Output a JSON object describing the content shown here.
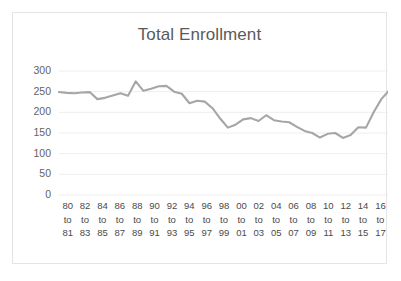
{
  "chart_data": {
    "type": "line",
    "title": "Total Enrollment",
    "xlabel": "",
    "ylabel": "",
    "ylim": [
      0,
      300
    ],
    "yticks": [
      300,
      250,
      200,
      150,
      100,
      50,
      0
    ],
    "grid": true,
    "legend": false,
    "line_color": "#a6a6a6",
    "categories": [
      "80 to 81",
      "81 to 82",
      "82 to 83",
      "83 to 84",
      "84 to 85",
      "85 to 86",
      "86 to 87",
      "87 to 88",
      "88 to 89",
      "89 to 90",
      "90 to 91",
      "91 to 92",
      "92 to 93",
      "93 to 94",
      "94 to 95",
      "95 to 96",
      "96 to 97",
      "97 to 98",
      "98 to 99",
      "99 to 00",
      "00 to 01",
      "01 to 02",
      "02 to 03",
      "03 to 04",
      "04 to 05",
      "05 to 06",
      "06 to 07",
      "07 to 08",
      "08 to 09",
      "09 to 10",
      "10 to 11",
      "11 to 12",
      "12 to 13",
      "13 to 14",
      "14 to 15",
      "15 to 16",
      "16 to 17",
      "17 to 18"
    ],
    "values": [
      249,
      247,
      246,
      248,
      249,
      232,
      235,
      241,
      246,
      240,
      275,
      252,
      257,
      263,
      264,
      250,
      245,
      222,
      228,
      226,
      210,
      185,
      163,
      170,
      183,
      186,
      179,
      193,
      181,
      178,
      176,
      165,
      155,
      150,
      139,
      148,
      150,
      138
    ],
    "tail_values": [
      145,
      164,
      163,
      200,
      232,
      253
    ],
    "xtick_labels": [
      {
        "start": "80",
        "mid": "to",
        "end": "81"
      },
      {
        "start": "82",
        "mid": "to",
        "end": "83"
      },
      {
        "start": "84",
        "mid": "to",
        "end": "85"
      },
      {
        "start": "86",
        "mid": "to",
        "end": "87"
      },
      {
        "start": "88",
        "mid": "to",
        "end": "89"
      },
      {
        "start": "90",
        "mid": "to",
        "end": "91"
      },
      {
        "start": "92",
        "mid": "to",
        "end": "93"
      },
      {
        "start": "94",
        "mid": "to",
        "end": "95"
      },
      {
        "start": "96",
        "mid": "to",
        "end": "97"
      },
      {
        "start": "98",
        "mid": "to",
        "end": "99"
      },
      {
        "start": "00",
        "mid": "to",
        "end": "01"
      },
      {
        "start": "02",
        "mid": "to",
        "end": "03"
      },
      {
        "start": "04",
        "mid": "to",
        "end": "05"
      },
      {
        "start": "06",
        "mid": "to",
        "end": "07"
      },
      {
        "start": "08",
        "mid": "to",
        "end": "09"
      },
      {
        "start": "10",
        "mid": "to",
        "end": "11"
      },
      {
        "start": "12",
        "mid": "to",
        "end": "13"
      },
      {
        "start": "14",
        "mid": "to",
        "end": "15"
      },
      {
        "start": "16",
        "mid": "to",
        "end": "17"
      }
    ]
  },
  "colors": {
    "line": "#a6a6a6",
    "grid": "#eeeeee",
    "border": "#e4e4e4",
    "title_text": "#5a5a5a",
    "tick_text": "#565656",
    "background": "#ffffff"
  }
}
